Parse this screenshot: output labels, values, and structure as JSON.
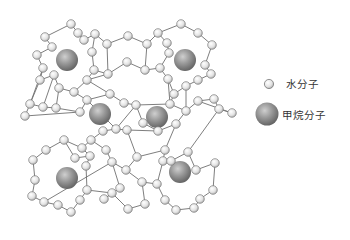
{
  "diagram": {
    "title": "",
    "colors": {
      "background": "#ffffff",
      "bond": "#6f6f6f",
      "water": "#e9e9e9",
      "water_stroke": "#7a7a7a",
      "methane": "#8a8a8a",
      "methane_highlight": "#c4c4c4"
    },
    "methane_molecules": [
      {
        "x": 67,
        "y": 60,
        "r": 11
      },
      {
        "x": 185,
        "y": 60,
        "r": 11
      },
      {
        "x": 100,
        "y": 114,
        "r": 11
      },
      {
        "x": 157,
        "y": 117,
        "r": 11
      },
      {
        "x": 67,
        "y": 178,
        "r": 11
      },
      {
        "x": 180,
        "y": 172,
        "r": 11
      }
    ],
    "water_molecules": [
      [
        71,
        24
      ],
      [
        45,
        37
      ],
      [
        52,
        47
      ],
      [
        37,
        55
      ],
      [
        43,
        68
      ],
      [
        40,
        80
      ],
      [
        54,
        75
      ],
      [
        59,
        88
      ],
      [
        74,
        92
      ],
      [
        87,
        80
      ],
      [
        94,
        70
      ],
      [
        92,
        52
      ],
      [
        84,
        40
      ],
      [
        95,
        34
      ],
      [
        78,
        33
      ],
      [
        107,
        44
      ],
      [
        108,
        74
      ],
      [
        127,
        62
      ],
      [
        145,
        70
      ],
      [
        147,
        44
      ],
      [
        128,
        36
      ],
      [
        181,
        24
      ],
      [
        158,
        33
      ],
      [
        167,
        43
      ],
      [
        198,
        33
      ],
      [
        212,
        45
      ],
      [
        205,
        65
      ],
      [
        211,
        74
      ],
      [
        198,
        80
      ],
      [
        186,
        86
      ],
      [
        174,
        94
      ],
      [
        168,
        79
      ],
      [
        160,
        68
      ],
      [
        169,
        53
      ],
      [
        30,
        104
      ],
      [
        43,
        107
      ],
      [
        25,
        116
      ],
      [
        56,
        108
      ],
      [
        80,
        112
      ],
      [
        87,
        100
      ],
      [
        110,
        94
      ],
      [
        124,
        103
      ],
      [
        116,
        129
      ],
      [
        103,
        131
      ],
      [
        91,
        140
      ],
      [
        82,
        148
      ],
      [
        136,
        105
      ],
      [
        143,
        123
      ],
      [
        158,
        131
      ],
      [
        176,
        124
      ],
      [
        170,
        104
      ],
      [
        186,
        111
      ],
      [
        198,
        101
      ],
      [
        214,
        99
      ],
      [
        219,
        109
      ],
      [
        232,
        113
      ],
      [
        127,
        130
      ],
      [
        64,
        140
      ],
      [
        46,
        150
      ],
      [
        33,
        160
      ],
      [
        35,
        180
      ],
      [
        32,
        196
      ],
      [
        44,
        202
      ],
      [
        58,
        205
      ],
      [
        71,
        212
      ],
      [
        80,
        200
      ],
      [
        87,
        190
      ],
      [
        86,
        166
      ],
      [
        90,
        156
      ],
      [
        75,
        158
      ],
      [
        106,
        150
      ],
      [
        112,
        162
      ],
      [
        126,
        170
      ],
      [
        137,
        157
      ],
      [
        142,
        182
      ],
      [
        145,
        204
      ],
      [
        128,
        209
      ],
      [
        112,
        193
      ],
      [
        104,
        199
      ],
      [
        120,
        188
      ],
      [
        165,
        150
      ],
      [
        163,
        161
      ],
      [
        171,
        161
      ],
      [
        188,
        152
      ],
      [
        196,
        170
      ],
      [
        215,
        163
      ],
      [
        213,
        190
      ],
      [
        200,
        199
      ],
      [
        194,
        208
      ],
      [
        176,
        210
      ],
      [
        165,
        200
      ],
      [
        157,
        184
      ]
    ],
    "bonds": [
      [
        0,
        14
      ],
      [
        14,
        12
      ],
      [
        12,
        13
      ],
      [
        13,
        11
      ],
      [
        0,
        1
      ],
      [
        1,
        2
      ],
      [
        2,
        3
      ],
      [
        3,
        4
      ],
      [
        4,
        5
      ],
      [
        5,
        6
      ],
      [
        6,
        7
      ],
      [
        7,
        8
      ],
      [
        8,
        9
      ],
      [
        9,
        10
      ],
      [
        10,
        11
      ],
      [
        13,
        15
      ],
      [
        15,
        20
      ],
      [
        20,
        19
      ],
      [
        19,
        18
      ],
      [
        18,
        17
      ],
      [
        17,
        16
      ],
      [
        16,
        15
      ],
      [
        10,
        16
      ],
      [
        9,
        16
      ],
      [
        19,
        22
      ],
      [
        22,
        21
      ],
      [
        21,
        24
      ],
      [
        24,
        25
      ],
      [
        25,
        26
      ],
      [
        26,
        27
      ],
      [
        27,
        28
      ],
      [
        28,
        29
      ],
      [
        29,
        30
      ],
      [
        30,
        31
      ],
      [
        31,
        32
      ],
      [
        32,
        33
      ],
      [
        33,
        23
      ],
      [
        23,
        22
      ],
      [
        18,
        32
      ],
      [
        34,
        35
      ],
      [
        35,
        37
      ],
      [
        34,
        36
      ],
      [
        37,
        38
      ],
      [
        38,
        39
      ],
      [
        39,
        40
      ],
      [
        40,
        41
      ],
      [
        41,
        46
      ],
      [
        42,
        43
      ],
      [
        43,
        44
      ],
      [
        44,
        45
      ],
      [
        42,
        46
      ],
      [
        46,
        47
      ],
      [
        47,
        48
      ],
      [
        48,
        49
      ],
      [
        49,
        51
      ],
      [
        51,
        50
      ],
      [
        50,
        46
      ],
      [
        51,
        52
      ],
      [
        52,
        53
      ],
      [
        53,
        54
      ],
      [
        54,
        55
      ],
      [
        55,
        52
      ],
      [
        42,
        56
      ],
      [
        56,
        48
      ],
      [
        7,
        37
      ],
      [
        8,
        39
      ],
      [
        9,
        40
      ],
      [
        30,
        50
      ],
      [
        29,
        51
      ],
      [
        31,
        50
      ],
      [
        45,
        57
      ],
      [
        57,
        58
      ],
      [
        58,
        59
      ],
      [
        59,
        60
      ],
      [
        60,
        61
      ],
      [
        61,
        62
      ],
      [
        62,
        63
      ],
      [
        63,
        64
      ],
      [
        64,
        65
      ],
      [
        65,
        66
      ],
      [
        66,
        67
      ],
      [
        67,
        68
      ],
      [
        68,
        69
      ],
      [
        69,
        57
      ],
      [
        68,
        45
      ],
      [
        44,
        70
      ],
      [
        70,
        71
      ],
      [
        71,
        72
      ],
      [
        72,
        73
      ],
      [
        73,
        56
      ],
      [
        72,
        74
      ],
      [
        74,
        75
      ],
      [
        75,
        76
      ],
      [
        76,
        77
      ],
      [
        77,
        78
      ],
      [
        78,
        79
      ],
      [
        79,
        71
      ],
      [
        77,
        66
      ],
      [
        73,
        80
      ],
      [
        80,
        81
      ],
      [
        81,
        82
      ],
      [
        82,
        83
      ],
      [
        83,
        84
      ],
      [
        84,
        85
      ],
      [
        85,
        86
      ],
      [
        86,
        87
      ],
      [
        87,
        88
      ],
      [
        88,
        89
      ],
      [
        89,
        90
      ],
      [
        90,
        91
      ],
      [
        91,
        74
      ],
      [
        81,
        91
      ],
      [
        49,
        80
      ],
      [
        83,
        54
      ],
      [
        39,
        42
      ],
      [
        38,
        36
      ],
      [
        5,
        34
      ],
      [
        4,
        34
      ],
      [
        6,
        35
      ],
      [
        62,
        71
      ]
    ]
  },
  "legend": {
    "items": [
      {
        "label": "水分子",
        "icon": "water-molecule-icon"
      },
      {
        "label": "甲烷分子",
        "icon": "methane-molecule-icon"
      }
    ]
  }
}
